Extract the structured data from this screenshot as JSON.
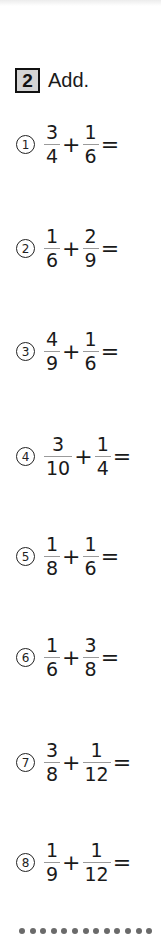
{
  "header": {
    "number": "2",
    "instruction": "Add."
  },
  "problems": [
    {
      "index": "1",
      "a_num": "3",
      "a_den": "4",
      "op": "+",
      "b_num": "1",
      "b_den": "6",
      "eq": "=",
      "top": 122
    },
    {
      "index": "2",
      "a_num": "1",
      "a_den": "6",
      "op": "+",
      "b_num": "2",
      "b_den": "9",
      "eq": "=",
      "top": 226
    },
    {
      "index": "3",
      "a_num": "4",
      "a_den": "9",
      "op": "+",
      "b_num": "1",
      "b_den": "6",
      "eq": "=",
      "top": 329
    },
    {
      "index": "4",
      "a_num": "3",
      "a_den": "10",
      "op": "+",
      "b_num": "1",
      "b_den": "4",
      "eq": "=",
      "top": 434
    },
    {
      "index": "5",
      "a_num": "1",
      "a_den": "8",
      "op": "+",
      "b_num": "1",
      "b_den": "6",
      "eq": "=",
      "top": 534
    },
    {
      "index": "6",
      "a_num": "1",
      "a_den": "6",
      "op": "+",
      "b_num": "3",
      "b_den": "8",
      "eq": "=",
      "top": 635
    },
    {
      "index": "7",
      "a_num": "3",
      "a_den": "8",
      "op": "+",
      "b_num": "1",
      "b_den": "12",
      "eq": "=",
      "top": 740
    },
    {
      "index": "8",
      "a_num": "1",
      "a_den": "9",
      "op": "+",
      "b_num": "1",
      "b_den": "12",
      "eq": "=",
      "top": 840
    }
  ],
  "circled_numerals": [
    "①",
    "②",
    "③",
    "④",
    "⑤",
    "⑥",
    "⑦",
    "⑧"
  ],
  "divider": {
    "dot_count": 13,
    "color": "#6a6a6a"
  }
}
